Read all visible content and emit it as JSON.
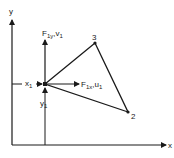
{
  "diagram": {
    "axes": {
      "y_label": "y",
      "x_label": "x"
    },
    "nodes": [
      {
        "id": "1",
        "label": "",
        "x": 45,
        "y": 84
      },
      {
        "id": "2",
        "label": "2",
        "x": 128,
        "y": 112
      },
      {
        "id": "3",
        "label": "3",
        "x": 95,
        "y": 43
      }
    ],
    "labels": {
      "force_y": "F",
      "force_y_sub": "1y",
      "force_y_suffix": ",v",
      "force_y_suffix_sub": "1",
      "force_x": "F",
      "force_x_sub": "1x",
      "force_x_suffix": ",u",
      "force_x_suffix_sub": "1",
      "coord_x": "x",
      "coord_x_sub": "1",
      "coord_y": "y",
      "coord_y_sub": "1",
      "node2": "2",
      "node3": "3"
    },
    "colors": {
      "stroke": "#1a1a1a",
      "background": "#ffffff"
    }
  }
}
